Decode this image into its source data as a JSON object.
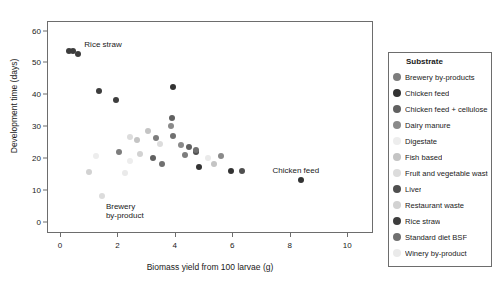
{
  "chart_data": {
    "type": "scatter",
    "title": "",
    "xlabel": "Biomass yield from 100 larvae (g)",
    "ylabel": "Development time (days)",
    "xlim": [
      -0.45,
      10.9
    ],
    "ylim": [
      -3.5,
      63
    ],
    "xticks": [
      0,
      2,
      4,
      6,
      8,
      10
    ],
    "yticks": [
      0,
      10,
      20,
      30,
      40,
      50,
      60
    ],
    "grid": false,
    "legend_position": "right",
    "legend_title": "Substrate",
    "series": [
      {
        "name": "Brewery by-products",
        "color": "#7d7d7d",
        "points": [
          {
            "x": 3.35,
            "y": 26.3
          },
          {
            "x": 4.35,
            "y": 21.0
          },
          {
            "x": 2.05,
            "y": 22.0
          }
        ]
      },
      {
        "name": "Chicken feed",
        "color": "#333333",
        "points": [
          {
            "x": 8.4,
            "y": 13.0
          },
          {
            "x": 5.95,
            "y": 16.0
          },
          {
            "x": 4.85,
            "y": 17.2
          },
          {
            "x": 3.95,
            "y": 42.2
          }
        ]
      },
      {
        "name": "Chicken feed + cellulose",
        "color": "#616161",
        "points": [
          {
            "x": 3.9,
            "y": 32.6
          },
          {
            "x": 4.5,
            "y": 23.5
          },
          {
            "x": 3.25,
            "y": 20.0
          }
        ]
      },
      {
        "name": "Dairy manure",
        "color": "#8a8a8a",
        "points": [
          {
            "x": 3.85,
            "y": 30.2
          },
          {
            "x": 4.2,
            "y": 24.2
          },
          {
            "x": 5.6,
            "y": 20.7
          }
        ]
      },
      {
        "name": "Digestate",
        "color": "#ededed",
        "points": [
          {
            "x": 1.25,
            "y": 20.8
          },
          {
            "x": 2.45,
            "y": 19.0
          }
        ]
      },
      {
        "name": "Fish based",
        "color": "#c4c4c4",
        "points": [
          {
            "x": 3.05,
            "y": 28.4
          },
          {
            "x": 2.7,
            "y": 25.8
          },
          {
            "x": 5.35,
            "y": 18.3
          }
        ]
      },
      {
        "name": "Fruit and vegetable waste",
        "color": "#dcdcdc",
        "points": [
          {
            "x": 3.5,
            "y": 24.3
          },
          {
            "x": 2.45,
            "y": 26.5
          },
          {
            "x": 1.45,
            "y": 8.0
          }
        ]
      },
      {
        "name": "Liver",
        "color": "#4f4f4f",
        "points": [
          {
            "x": 4.75,
            "y": 22.0
          },
          {
            "x": 6.35,
            "y": 15.9
          }
        ]
      },
      {
        "name": "Restaurant waste",
        "color": "#d2d2d2",
        "points": [
          {
            "x": 2.8,
            "y": 21.2
          },
          {
            "x": 1.0,
            "y": 15.5
          }
        ]
      },
      {
        "name": "Rice straw",
        "color": "#3d3d3d",
        "points": [
          {
            "x": 0.3,
            "y": 53.7
          },
          {
            "x": 0.45,
            "y": 53.6
          },
          {
            "x": 0.62,
            "y": 52.7
          },
          {
            "x": 1.35,
            "y": 41.0
          },
          {
            "x": 1.95,
            "y": 38.2
          }
        ]
      },
      {
        "name": "Standard diet BSF",
        "color": "#707070",
        "points": [
          {
            "x": 3.95,
            "y": 27.0
          },
          {
            "x": 3.55,
            "y": 18.0
          },
          {
            "x": 4.75,
            "y": 22.5
          }
        ]
      },
      {
        "name": "Winery by-product",
        "color": "#eaeaea",
        "points": [
          {
            "x": 2.25,
            "y": 15.2
          },
          {
            "x": 5.15,
            "y": 20.0
          }
        ]
      }
    ],
    "annotations": [
      {
        "name": "rice-straw",
        "text": "Rice straw",
        "x": 0.85,
        "y": 57.0
      },
      {
        "name": "brewery-by-product",
        "text": "Brewery\nby-product",
        "x": 1.6,
        "y": 6.3
      },
      {
        "name": "chicken-feed",
        "text": "Chicken feed",
        "x": 7.4,
        "y": 17.6
      }
    ]
  },
  "legend": {
    "title": "Substrate",
    "items": [
      {
        "label": "Brewery by-products",
        "color": "#7d7d7d"
      },
      {
        "label": "Chicken feed",
        "color": "#333333"
      },
      {
        "label": "Chicken feed + cellulose",
        "color": "#616161"
      },
      {
        "label": "Dairy manure",
        "color": "#8a8a8a"
      },
      {
        "label": "Digestate",
        "color": "#ededed"
      },
      {
        "label": "Fish based",
        "color": "#c4c4c4"
      },
      {
        "label": "Fruit and vegetable waste",
        "color": "#dcdcdc"
      },
      {
        "label": "Liver",
        "color": "#4f4f4f"
      },
      {
        "label": "Restaurant waste",
        "color": "#d2d2d2"
      },
      {
        "label": "Rice straw",
        "color": "#3d3d3d"
      },
      {
        "label": "Standard diet BSF",
        "color": "#707070"
      },
      {
        "label": "Winery by-product",
        "color": "#eaeaea"
      }
    ]
  }
}
